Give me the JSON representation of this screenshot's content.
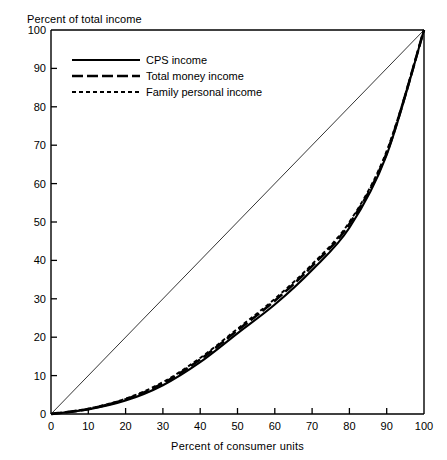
{
  "chart_data": {
    "type": "line",
    "title": "",
    "xlabel": "Percent of consumer units",
    "ylabel": "Percent of total income",
    "xlim": [
      0,
      100
    ],
    "ylim": [
      0,
      100
    ],
    "grid": false,
    "legend_position": "top-left",
    "xticks": [
      "0",
      "10",
      "20",
      "30",
      "40",
      "50",
      "60",
      "70",
      "80",
      "90",
      "100"
    ],
    "yticks": [
      "0",
      "10",
      "20",
      "30",
      "40",
      "50",
      "60",
      "70",
      "80",
      "90",
      "100"
    ],
    "x": [
      0,
      10,
      20,
      30,
      40,
      50,
      60,
      70,
      80,
      90,
      100
    ],
    "series": [
      {
        "name": "CPS income",
        "style": "solid",
        "values": [
          0,
          1.2,
          3.5,
          7.5,
          13.5,
          21.0,
          28.5,
          37.5,
          48.5,
          67.5,
          100
        ]
      },
      {
        "name": "Total money income",
        "style": "long-dash",
        "values": [
          0,
          1.3,
          3.8,
          8.0,
          14.2,
          21.8,
          29.5,
          38.5,
          49.5,
          68.0,
          100
        ]
      },
      {
        "name": "Family personal income",
        "style": "short-dash",
        "values": [
          0,
          1.4,
          4.0,
          8.3,
          14.6,
          22.2,
          30.0,
          39.0,
          50.0,
          68.5,
          100
        ]
      },
      {
        "name": "line of equality",
        "style": "thin-solid",
        "values": [
          0,
          10,
          20,
          30,
          40,
          50,
          60,
          70,
          80,
          90,
          100
        ]
      }
    ],
    "legend": [
      {
        "label": "CPS income",
        "style": "solid"
      },
      {
        "label": "Total money income",
        "style": "long-dash"
      },
      {
        "label": "Family personal income",
        "style": "short-dash"
      }
    ]
  },
  "axes": {
    "y_title": "Percent of total income",
    "x_title": "Percent of consumer units"
  }
}
